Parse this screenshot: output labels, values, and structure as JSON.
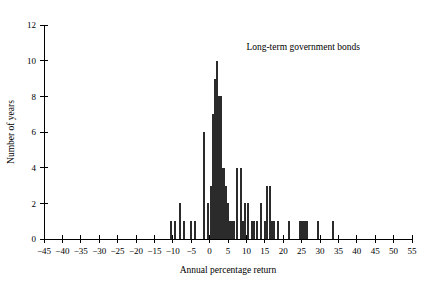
{
  "chart_data": {
    "type": "bar",
    "title": "Long-term government bonds",
    "subtitle": "",
    "xlabel": "Annual percentage return",
    "ylabel": "Number of years",
    "xlim": [
      -45,
      55
    ],
    "ylim": [
      0,
      12
    ],
    "xticks": [
      -45,
      -40,
      -35,
      -30,
      -25,
      -20,
      -15,
      -10,
      -5,
      0,
      5,
      10,
      15,
      20,
      25,
      30,
      35,
      40,
      45,
      50,
      55
    ],
    "xtick_labels": [
      "−45",
      "−40",
      "−35",
      "−30",
      "−25",
      "−20",
      "−15",
      "−10",
      "−5",
      "0",
      "5",
      "10",
      "15",
      "20",
      "25",
      "30",
      "35",
      "40",
      "45",
      "50",
      "55"
    ],
    "yticks": [
      0,
      2,
      4,
      6,
      8,
      10,
      12
    ],
    "ytick_labels": [
      "0",
      "2",
      "4",
      "6",
      "8",
      "10",
      "12"
    ],
    "grid": false,
    "legend": "none",
    "bar_color": "#2b2b2b",
    "bar_width": 0.55,
    "x": [
      -10.5,
      -9.5,
      -8.0,
      -7.0,
      -5.0,
      -4.0,
      -1.5,
      -0.5,
      0.5,
      1.0,
      1.5,
      2.0,
      2.5,
      3.0,
      3.5,
      4.0,
      4.5,
      5.0,
      5.5,
      6.0,
      6.5,
      7.5,
      8.5,
      9.0,
      9.5,
      10.5,
      11.5,
      12.0,
      13.0,
      14.0,
      15.0,
      15.5,
      16.5,
      17.0,
      17.5,
      18.5,
      21.5,
      24.5,
      25.0,
      25.5,
      26.0,
      26.5,
      29.5,
      33.5
    ],
    "values": [
      1,
      1,
      2,
      1,
      1,
      1,
      6,
      2,
      3,
      7,
      9,
      10,
      8,
      8,
      4,
      4,
      3,
      2,
      1,
      1,
      1,
      4,
      4,
      1,
      2,
      2,
      1,
      1,
      1,
      2,
      1,
      3,
      3,
      1,
      1,
      1,
      1,
      1,
      1,
      1,
      1,
      1,
      1,
      1
    ]
  },
  "annotations": {
    "series_label": "Long-term government bonds"
  }
}
